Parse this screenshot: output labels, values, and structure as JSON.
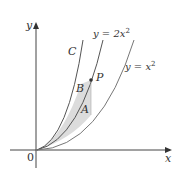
{
  "figure": {
    "axes": {
      "x_label": "x",
      "y_label": "y",
      "origin_label": "0"
    },
    "curves": [
      {
        "id": "C",
        "label": "C"
      },
      {
        "id": "y2x2",
        "label": "y = 2x",
        "exp": "2"
      },
      {
        "id": "yx2",
        "label": "y = x",
        "exp": "2"
      }
    ],
    "regions": [
      {
        "label": "A"
      },
      {
        "label": "B"
      }
    ],
    "point": {
      "label": "P"
    },
    "colors": {
      "curve": "#555555",
      "shade": "#d9d9d9",
      "axis": "#444444"
    }
  }
}
